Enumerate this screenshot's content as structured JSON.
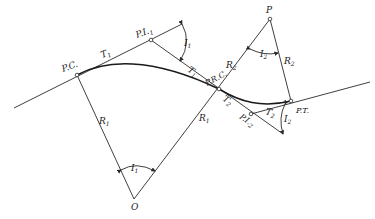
{
  "figure": {
    "header_fragment": "",
    "points": {
      "pc": {
        "label": "P.C."
      },
      "pi1": {
        "label": "P.I.",
        "sub": "1"
      },
      "prc": {
        "label": "P.R.C."
      },
      "pi2": {
        "label": "P.I.",
        "sub": "2"
      },
      "pt": {
        "label": "P.T."
      },
      "o": {
        "label": "O"
      },
      "p": {
        "label": "P"
      }
    },
    "tangents": {
      "t1_a": {
        "label": "T",
        "sub": "1"
      },
      "t1_b": {
        "label": "T",
        "sub": "1"
      },
      "t2_a": {
        "label": "T",
        "sub": "2"
      },
      "t2_b": {
        "label": "T",
        "sub": "2"
      }
    },
    "radii": {
      "r1_a": {
        "label": "R",
        "sub": "1"
      },
      "r1_b": {
        "label": "R",
        "sub": "1"
      },
      "r2_a": {
        "label": "R",
        "sub": "2"
      },
      "r2_b": {
        "label": "R",
        "sub": "2"
      }
    },
    "angles": {
      "i1_at_pi1": {
        "label": "I",
        "sub": "1"
      },
      "i1_at_o": {
        "label": "I",
        "sub": "1"
      },
      "i2_at_p": {
        "label": "I",
        "sub": "2"
      },
      "i2_at_pi2": {
        "label": "I",
        "sub": "2"
      }
    }
  }
}
